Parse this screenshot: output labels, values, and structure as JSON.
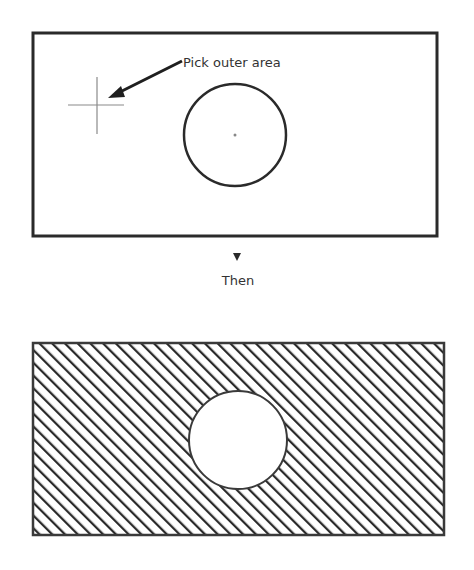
{
  "diagram": {
    "step1": {
      "annotation": "Pick outer area",
      "box": {
        "x": 33,
        "y": 33,
        "width": 404,
        "height": 203
      },
      "circle": {
        "cx": 235,
        "cy": 135,
        "r": 51
      },
      "cursor": {
        "x": 97,
        "y": 105,
        "half_width": 28,
        "half_height": 28
      },
      "arrow": {
        "from": [
          182,
          61
        ],
        "to": [
          110,
          97
        ]
      }
    },
    "connector": {
      "label": "Then",
      "icon": "down-triangle-icon"
    },
    "step2": {
      "box": {
        "x": 33,
        "y": 343,
        "width": 411,
        "height": 192
      },
      "hole": {
        "cx": 238,
        "cy": 440,
        "r": 49
      },
      "fill": "diagonal-hatch",
      "hatch_spacing": 9
    },
    "colors": {
      "stroke": "#2a2a2a",
      "cursor": "#8a8a8a",
      "text": "#333333",
      "background": "#ffffff"
    }
  }
}
